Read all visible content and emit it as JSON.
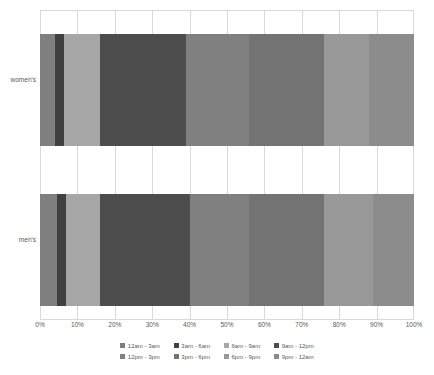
{
  "chart_data": {
    "type": "bar",
    "orientation": "horizontal",
    "stacked": true,
    "normalized": true,
    "title": "",
    "xlabel": "",
    "ylabel": "",
    "xlim": [
      0,
      100
    ],
    "xticks": [
      "0%",
      "10%",
      "20%",
      "30%",
      "40%",
      "50%",
      "60%",
      "70%",
      "80%",
      "90%",
      "100%"
    ],
    "xtick_values": [
      0,
      10,
      20,
      30,
      40,
      50,
      60,
      70,
      80,
      90,
      100
    ],
    "grid": true,
    "legend_position": "bottom",
    "categories": [
      "women's",
      "men's"
    ],
    "series": [
      {
        "name": "12am - 3am",
        "color": "#7f7f7f",
        "values": [
          4.0,
          4.5
        ]
      },
      {
        "name": "3am - 6am",
        "color": "#404040",
        "values": [
          2.5,
          2.5
        ]
      },
      {
        "name": "6am - 9am",
        "color": "#a6a6a6",
        "values": [
          9.5,
          9.0
        ]
      },
      {
        "name": "9am - 12pm",
        "color": "#4d4d4d",
        "values": [
          23.0,
          24.0
        ]
      },
      {
        "name": "12pm - 3pm",
        "color": "#808080",
        "values": [
          17.0,
          16.0
        ]
      },
      {
        "name": "3pm - 6pm",
        "color": "#737373",
        "values": [
          20.0,
          20.0
        ]
      },
      {
        "name": "6pm - 9pm",
        "color": "#999999",
        "values": [
          12.0,
          13.0
        ]
      },
      {
        "name": "9pm - 12am",
        "color": "#8c8c8c",
        "values": [
          12.0,
          11.0
        ]
      }
    ]
  },
  "axis": {
    "ticks": [
      "0%",
      "10%",
      "20%",
      "30%",
      "40%",
      "50%",
      "60%",
      "70%",
      "80%",
      "90%",
      "100%"
    ]
  },
  "categories": {
    "womens": "women's",
    "mens": "men's"
  },
  "legend": {
    "items": [
      {
        "label": "12am - 3am"
      },
      {
        "label": "3am - 6am"
      },
      {
        "label": "6am - 9am"
      },
      {
        "label": "9am - 12pm"
      },
      {
        "label": "12pm - 3pm"
      },
      {
        "label": "3pm - 6pm"
      },
      {
        "label": "6pm - 9pm"
      },
      {
        "label": "9pm - 12am"
      }
    ]
  },
  "colors": {
    "grid": "#d9d9d9",
    "text": "#595959",
    "background": "#ffffff"
  }
}
